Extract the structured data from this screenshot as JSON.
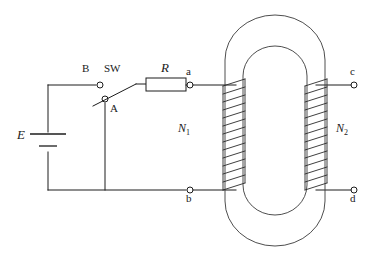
{
  "figure": {
    "kind": "transformer-circuit-schematic",
    "background_color": "#ffffff",
    "line_color": "#1c1c1c"
  },
  "labels": {
    "source": "E",
    "switch": "SW",
    "switch_terminal_b": "B",
    "switch_terminal_a": "A",
    "resistor": "R",
    "terminal_a": "a",
    "terminal_b": "b",
    "terminal_c": "c",
    "terminal_d": "d",
    "primary_turns": "N",
    "primary_turns_sub": "1",
    "secondary_turns": "N",
    "secondary_turns_sub": "2"
  },
  "components": {
    "battery": {
      "name": "E",
      "type": "dc-source"
    },
    "switch": {
      "name": "SW",
      "type": "spst-knife-switch",
      "poles": [
        "B",
        "A"
      ],
      "state": "open"
    },
    "resistor": {
      "name": "R",
      "type": "resistor"
    },
    "transformer": {
      "core": "closed-racetrack-laminated-core",
      "primary": {
        "label": "N1",
        "turns": 14,
        "terminals": [
          "a",
          "b"
        ]
      },
      "secondary": {
        "label": "N2",
        "turns": 14,
        "terminals": [
          "c",
          "d"
        ]
      }
    }
  },
  "terminals": [
    {
      "id": "B",
      "x": 100,
      "y": 85
    },
    {
      "id": "A",
      "x": 105,
      "y": 99
    },
    {
      "id": "a",
      "x": 190,
      "y": 86
    },
    {
      "id": "b",
      "x": 190,
      "y": 190
    },
    {
      "id": "c",
      "x": 354,
      "y": 86
    },
    {
      "id": "d",
      "x": 354,
      "y": 190
    }
  ]
}
